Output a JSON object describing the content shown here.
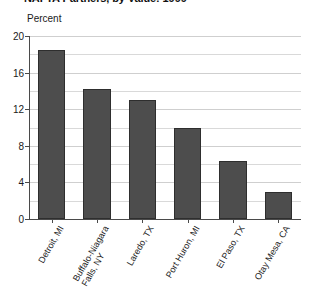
{
  "chart_data": {
    "type": "bar",
    "title": "NAFTA Partners, by Value: 1999",
    "subtitle": "",
    "xlabel": "",
    "ylabel": "Percent",
    "ylim": [
      0,
      20
    ],
    "yticks": [
      0,
      4,
      8,
      12,
      16,
      20
    ],
    "ytick_labels": [
      "0",
      "4",
      "8",
      "12",
      "16",
      "20"
    ],
    "minor_gridline_step": 2,
    "grid": true,
    "legend": false,
    "legend_position": "none",
    "bar_color": "#4d4d4d",
    "bar_edge_color": "#2e2e2e",
    "gridline_color": "#d9d9d9",
    "axis_color": "#4a4a4a",
    "categories": [
      "Detroit, MI",
      "Buffalo-Niagara Falls, NY",
      "Laredo, TX",
      "Port Huron, MI",
      "El Paso, TX",
      "Otay Mesa, CA"
    ],
    "category_lines": [
      [
        "Detroit, MI"
      ],
      [
        "Buffalo-Niagara",
        "Falls, NY"
      ],
      [
        "Laredo, TX"
      ],
      [
        "Port Huron, MI"
      ],
      [
        "El Paso, TX"
      ],
      [
        "Otay Mesa, CA"
      ]
    ],
    "values": [
      18.5,
      14.2,
      13.0,
      9.9,
      6.3,
      3.0
    ]
  }
}
